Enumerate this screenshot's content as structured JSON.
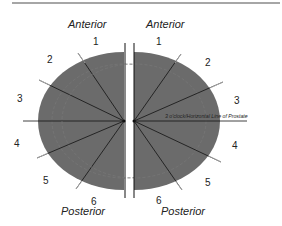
{
  "diagram": {
    "colors": {
      "gland_fill": "#6b6b6b",
      "line": "#111111",
      "top_rule": "#888888",
      "text": "#222222"
    },
    "left": {
      "anterior_label": "Anterior",
      "posterior_label": "Posterior",
      "clock_numbers": [
        "1",
        "2",
        "3",
        "4",
        "5",
        "6"
      ]
    },
    "right": {
      "anterior_label": "Anterior",
      "posterior_label": "Posterior",
      "clock_numbers": [
        "1",
        "2",
        "3",
        "4",
        "5",
        "6"
      ],
      "horizontal_line_label": "3 o'clock/Horizontal Line of Prostate"
    }
  }
}
